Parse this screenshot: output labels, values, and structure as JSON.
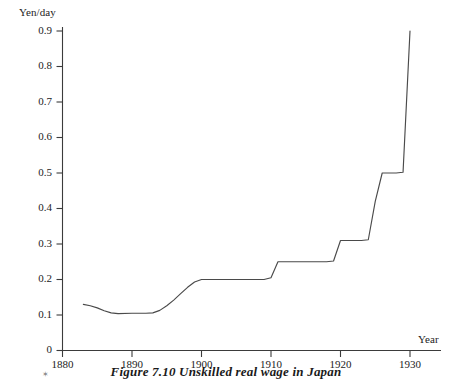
{
  "figure": {
    "caption": "Figure 7.10  Unskilled real wage in Japan",
    "speck": "✶"
  },
  "axes": {
    "y_title": "Yen/day",
    "x_title": "Year"
  },
  "chart_data": {
    "type": "line",
    "title": "Figure 7.10  Unskilled real wage in Japan",
    "xlabel": "Year",
    "ylabel": "Yen/day",
    "xlim": [
      1878,
      1934
    ],
    "ylim": [
      0,
      0.95
    ],
    "grid": false,
    "legend": null,
    "x_ticks": [
      1880,
      1890,
      1900,
      1910,
      1920,
      1930
    ],
    "x_tick_labels": [
      "1880",
      "1890",
      "1900",
      "1910",
      "1920",
      "1930"
    ],
    "y_ticks": [
      0,
      0.1,
      0.2,
      0.3,
      0.4,
      0.5,
      0.6,
      0.7,
      0.8,
      0.9
    ],
    "y_tick_labels": [
      "0",
      "0.1",
      "0.2",
      "0.3",
      "0.4",
      "0.5",
      "0.6",
      "0.7",
      "0.8",
      "0.9"
    ],
    "series": [
      {
        "name": "Unskilled real wage",
        "color": "#4a4a4a",
        "x": [
          1883,
          1884,
          1885,
          1886,
          1887,
          1888,
          1890,
          1892,
          1893,
          1894,
          1895,
          1896,
          1897,
          1898,
          1899,
          1900,
          1905,
          1909,
          1910,
          1911,
          1915,
          1918,
          1919,
          1920,
          1923,
          1924,
          1925,
          1926,
          1927,
          1928,
          1929,
          1930
        ],
        "y": [
          0.13,
          0.126,
          0.12,
          0.112,
          0.106,
          0.104,
          0.105,
          0.105,
          0.106,
          0.113,
          0.126,
          0.142,
          0.16,
          0.178,
          0.193,
          0.2,
          0.2,
          0.2,
          0.205,
          0.25,
          0.25,
          0.25,
          0.252,
          0.31,
          0.31,
          0.312,
          0.42,
          0.5,
          0.5,
          0.5,
          0.502,
          0.9
        ]
      }
    ]
  }
}
